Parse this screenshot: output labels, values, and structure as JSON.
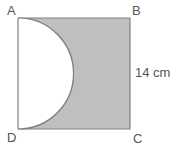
{
  "figure": {
    "type": "geometry-diagram",
    "shape": "square",
    "vertices": [
      {
        "name": "A",
        "label": "A",
        "position": "top-left"
      },
      {
        "name": "B",
        "label": "B",
        "position": "top-right"
      },
      {
        "name": "C",
        "label": "C",
        "position": "bottom-right"
      },
      {
        "name": "D",
        "label": "D",
        "position": "bottom-left"
      }
    ],
    "dimension": {
      "label": "14 cm",
      "value": 14,
      "unit": "cm",
      "side": "BC",
      "position": "right"
    },
    "semicircle": {
      "diameter_side": "AD",
      "diameter_value": 14,
      "radius_value": 7,
      "unit": "cm",
      "fill": "white",
      "bulge_direction": "right"
    },
    "colors": {
      "shaded_fill": "#bfbfbf",
      "outline": "#808080",
      "cutout_fill": "#ffffff",
      "label_text": "#555555",
      "background": "#ffffff"
    },
    "geometry_px": {
      "square_left": 18,
      "square_top": 18,
      "square_right": 130,
      "square_bottom": 129,
      "arc_center_x": 18,
      "arc_center_y": 73.5,
      "arc_radius": 55.5
    }
  }
}
